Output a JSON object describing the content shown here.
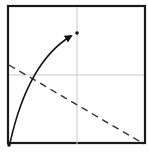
{
  "diagram": {
    "type": "origami-fold-step",
    "paper": {
      "x": 8,
      "y": 6,
      "size": 137,
      "stroke": "#1a1a1a",
      "fill": "#ffffff"
    },
    "creases": [
      {
        "name": "vertical-center-crease",
        "x1": 77,
        "y1": 7,
        "x2": 77,
        "y2": 144,
        "color": "#c8c8c8"
      },
      {
        "name": "horizontal-center-crease",
        "x1": 9,
        "y1": 75,
        "x2": 144,
        "y2": 75,
        "color": "#c8c8c8"
      }
    ],
    "fold_line": {
      "style": "valley-dashed",
      "x1": 9,
      "y1": 65,
      "x2": 144,
      "y2": 144,
      "color": "#333333"
    },
    "arrow": {
      "from": [
        10,
        143
      ],
      "ctrl": [
        28,
        62
      ],
      "to": [
        71,
        36
      ],
      "color": "#111111"
    },
    "points": [
      {
        "name": "target-point",
        "x": 77,
        "y": 33
      },
      {
        "name": "corner-point",
        "x": 9,
        "y": 145
      }
    ]
  }
}
